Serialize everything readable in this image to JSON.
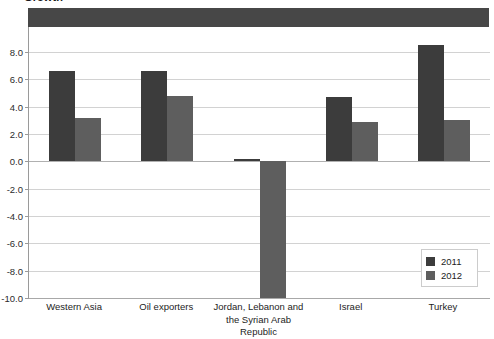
{
  "chart_data": {
    "type": "bar",
    "title": "Growth",
    "categories": [
      "Western Asia",
      "Oil exporters",
      "Jordan, Lebanon and\nthe Syrian Arab Republic",
      "Israel",
      "Turkey"
    ],
    "series": [
      {
        "name": "2011",
        "values": [
          6.6,
          6.6,
          0.2,
          4.7,
          8.5
        ],
        "color": "#3c3c3c"
      },
      {
        "name": "2012",
        "values": [
          3.2,
          4.8,
          -10.0,
          2.9,
          3.0
        ],
        "color": "#5e5e5e"
      }
    ],
    "xlabel": "",
    "ylabel": "",
    "ylim": [
      -10.0,
      8.0
    ],
    "ytick_labels": [
      "8.0",
      "6.0",
      "4.0",
      "2.0",
      "0.0",
      "-2.0",
      "-4.0",
      "-6.0",
      "-8.0",
      "-10.0"
    ],
    "ytick_values": [
      8.0,
      6.0,
      4.0,
      2.0,
      0.0,
      -2.0,
      -4.0,
      -6.0,
      -8.0,
      -10.0
    ],
    "grid": true,
    "legend_position": "bottom-right",
    "legend_entries": [
      "2011",
      "2012"
    ]
  },
  "legend": {
    "entries": [
      {
        "label": "2011"
      },
      {
        "label": "2012"
      }
    ]
  }
}
